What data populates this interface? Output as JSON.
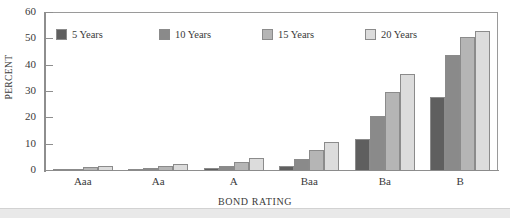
{
  "chart_data": {
    "type": "bar",
    "title": "",
    "xlabel": "BOND RATING",
    "ylabel": "PERCENT",
    "categories": [
      "Aaa",
      "Aa",
      "A",
      "Baa",
      "Ba",
      "B"
    ],
    "series": [
      {
        "name": "5 Years",
        "color": "#5f5f5f",
        "values": [
          0.3,
          0.4,
          1.0,
          2.0,
          12.0,
          28.0
        ]
      },
      {
        "name": "10 Years",
        "color": "#8a8a8a",
        "values": [
          0.5,
          1.0,
          2.0,
          4.5,
          21.0,
          44.0
        ]
      },
      {
        "name": "15 Years",
        "color": "#b5b5b5",
        "values": [
          1.5,
          2.0,
          3.5,
          8.0,
          30.0,
          51.0
        ]
      },
      {
        "name": "20 Years",
        "color": "#dcdcdc",
        "values": [
          2.0,
          2.5,
          5.0,
          11.0,
          37.0,
          53.0
        ]
      }
    ],
    "ylim": [
      0,
      60
    ],
    "yticks": [
      0,
      10,
      20,
      30,
      40,
      50,
      60
    ],
    "grid": false,
    "legend_position": "top-left"
  },
  "legend": {
    "items": [
      {
        "label": "5 Years"
      },
      {
        "label": "10 Years"
      },
      {
        "label": "15 Years"
      },
      {
        "label": "20 Years"
      }
    ]
  }
}
